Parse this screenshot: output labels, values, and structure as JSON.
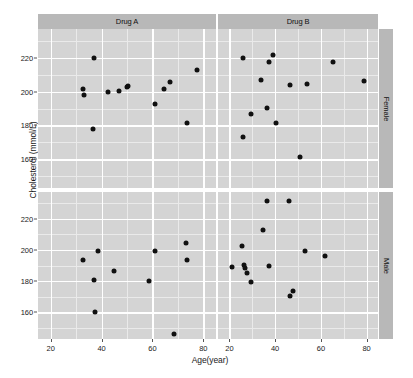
{
  "chart_data": {
    "type": "scatter",
    "title": "",
    "xlabel": "Age(year)",
    "ylabel": "Cholesterol (mmol/L)",
    "xlim": [
      15,
      85
    ],
    "ylim": [
      143,
      237
    ],
    "xticks": [
      20,
      40,
      60,
      80
    ],
    "yticks": [
      160,
      180,
      200,
      220
    ],
    "grid": true,
    "legend": "none",
    "facet_cols": [
      "Drug A",
      "Drug B"
    ],
    "facet_rows": [
      "Female",
      "Male"
    ],
    "facet_col_label": "Drug",
    "facet_row_label": "Sex",
    "panels": [
      {
        "drug": "Drug A",
        "sex": "Female",
        "points": [
          {
            "x": 32.5,
            "y": 201.5
          },
          {
            "x": 33.0,
            "y": 198.0
          },
          {
            "x": 36.5,
            "y": 178.0
          },
          {
            "x": 37.0,
            "y": 220.0
          },
          {
            "x": 42.5,
            "y": 199.5
          },
          {
            "x": 47.0,
            "y": 200.5
          },
          {
            "x": 50.0,
            "y": 203.0
          },
          {
            "x": 50.5,
            "y": 203.5
          },
          {
            "x": 61.0,
            "y": 192.5
          },
          {
            "x": 64.5,
            "y": 201.5
          },
          {
            "x": 67.0,
            "y": 205.5
          },
          {
            "x": 73.5,
            "y": 181.5
          },
          {
            "x": 77.5,
            "y": 212.5
          }
        ]
      },
      {
        "drug": "Drug B",
        "sex": "Female",
        "points": [
          {
            "x": 26.0,
            "y": 220.0
          },
          {
            "x": 26.0,
            "y": 173.0
          },
          {
            "x": 29.5,
            "y": 186.5
          },
          {
            "x": 34.0,
            "y": 207.0
          },
          {
            "x": 36.5,
            "y": 190.5
          },
          {
            "x": 37.5,
            "y": 217.5
          },
          {
            "x": 39.0,
            "y": 221.5
          },
          {
            "x": 40.5,
            "y": 181.5
          },
          {
            "x": 46.5,
            "y": 204.0
          },
          {
            "x": 51.0,
            "y": 161.5
          },
          {
            "x": 54.0,
            "y": 204.5
          },
          {
            "x": 65.5,
            "y": 217.5
          },
          {
            "x": 79.0,
            "y": 206.0
          }
        ]
      },
      {
        "drug": "Drug A",
        "sex": "Male",
        "points": [
          {
            "x": 32.5,
            "y": 193.5
          },
          {
            "x": 37.0,
            "y": 181.0
          },
          {
            "x": 37.5,
            "y": 160.5
          },
          {
            "x": 38.5,
            "y": 199.0
          },
          {
            "x": 45.0,
            "y": 186.5
          },
          {
            "x": 58.5,
            "y": 180.0
          },
          {
            "x": 61.0,
            "y": 199.0
          },
          {
            "x": 68.5,
            "y": 146.0
          },
          {
            "x": 73.0,
            "y": 204.5
          },
          {
            "x": 73.5,
            "y": 193.5
          }
        ]
      },
      {
        "drug": "Drug B",
        "sex": "Male",
        "points": [
          {
            "x": 21.0,
            "y": 189.0
          },
          {
            "x": 25.5,
            "y": 202.5
          },
          {
            "x": 26.5,
            "y": 190.5
          },
          {
            "x": 27.0,
            "y": 188.5
          },
          {
            "x": 27.5,
            "y": 185.0
          },
          {
            "x": 29.5,
            "y": 179.5
          },
          {
            "x": 34.5,
            "y": 213.0
          },
          {
            "x": 36.5,
            "y": 231.0
          },
          {
            "x": 37.5,
            "y": 190.0
          },
          {
            "x": 46.0,
            "y": 231.0
          },
          {
            "x": 46.5,
            "y": 170.5
          },
          {
            "x": 48.0,
            "y": 174.0
          },
          {
            "x": 53.0,
            "y": 199.0
          },
          {
            "x": 62.0,
            "y": 196.0
          }
        ]
      }
    ]
  }
}
